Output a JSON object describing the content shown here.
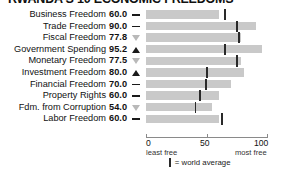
{
  "title": "RWANDA'S 10 ECONOMIC FREEDOMS",
  "colors": {
    "bar": "#c9c9c9",
    "average_tick": "#2a2a2a",
    "axis": "#8a8a8a",
    "trend_up": "#1a1a1a",
    "trend_down": "#b9b9b9",
    "text": "#111111",
    "background": "#ffffff"
  },
  "axis": {
    "ticks": [
      {
        "value": 0,
        "label": "0"
      },
      {
        "value": 50,
        "label": "50"
      },
      {
        "value": 100,
        "label": "100"
      }
    ],
    "min_label": "least free",
    "max_label": "most free",
    "min": 0,
    "max": 100
  },
  "legend": {
    "mark": "world-average-tick",
    "text": "= world average"
  },
  "chart_data": {
    "type": "bar",
    "title": "RWANDA'S 10 ECONOMIC FREEDOMS",
    "xlabel": "",
    "ylabel": "",
    "xlim": [
      0,
      100
    ],
    "grid": false,
    "orientation": "horizontal",
    "legend_position": "bottom",
    "categories": [
      "Business Freedom",
      "Trade Freedom",
      "Fiscal Freedom",
      "Government Spending",
      "Monetary Freedom",
      "Investment Freedom",
      "Financial Freedom",
      "Property Rights",
      "Fdm. from Corruption",
      "Labor Freedom"
    ],
    "values": [
      60.0,
      90.0,
      77.8,
      95.2,
      77.5,
      80.0,
      70.0,
      60.0,
      54.0,
      60.0
    ],
    "value_labels": [
      "60.0",
      "90.0",
      "77.8",
      "95.2",
      "77.5",
      "80.0",
      "70.0",
      "60.0",
      "54.0",
      "60.0"
    ],
    "trends": [
      "flat",
      "flat",
      "down",
      "up",
      "down",
      "up",
      "flat",
      "flat",
      "down",
      "flat"
    ],
    "world_average": [
      64.6,
      74.5,
      76.3,
      64.5,
      74.3,
      50.2,
      49.0,
      44.0,
      40.5,
      62.1
    ],
    "series": [
      {
        "name": "Rwanda score",
        "values": [
          60.0,
          90.0,
          77.8,
          95.2,
          77.5,
          80.0,
          70.0,
          60.0,
          54.0,
          60.0
        ]
      },
      {
        "name": "world average",
        "values": [
          64.6,
          74.5,
          76.3,
          64.5,
          74.3,
          50.2,
          49.0,
          44.0,
          40.5,
          62.1
        ]
      }
    ]
  },
  "rows": [
    {
      "label": "Business Freedom",
      "value": "60.0",
      "trend": "flat",
      "score": 60.0,
      "average": 64.6
    },
    {
      "label": "Trade Freedom",
      "value": "90.0",
      "trend": "flat",
      "score": 90.0,
      "average": 74.5
    },
    {
      "label": "Fiscal Freedom",
      "value": "77.8",
      "trend": "down",
      "score": 77.8,
      "average": 76.3
    },
    {
      "label": "Government Spending",
      "value": "95.2",
      "trend": "up",
      "score": 95.2,
      "average": 64.5
    },
    {
      "label": "Monetary Freedom",
      "value": "77.5",
      "trend": "down",
      "score": 77.5,
      "average": 74.3
    },
    {
      "label": "Investment Freedom",
      "value": "80.0",
      "trend": "up",
      "score": 80.0,
      "average": 50.2
    },
    {
      "label": "Financial Freedom",
      "value": "70.0",
      "trend": "flat",
      "score": 70.0,
      "average": 49.0
    },
    {
      "label": "Property Rights",
      "value": "60.0",
      "trend": "flat",
      "score": 60.0,
      "average": 44.0
    },
    {
      "label": "Fdm. from Corruption",
      "value": "54.0",
      "trend": "down",
      "score": 54.0,
      "average": 40.5
    },
    {
      "label": "Labor Freedom",
      "value": "60.0",
      "trend": "flat",
      "score": 60.0,
      "average": 62.1
    }
  ]
}
